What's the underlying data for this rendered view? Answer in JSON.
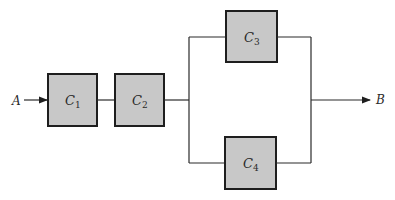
{
  "diagram": {
    "type": "reliability-block-diagram",
    "input_label": "A",
    "output_label": "B",
    "components": [
      {
        "id": "C1",
        "label": "C",
        "sub": "1"
      },
      {
        "id": "C2",
        "label": "C",
        "sub": "2"
      },
      {
        "id": "C3",
        "label": "C",
        "sub": "3"
      },
      {
        "id": "C4",
        "label": "C",
        "sub": "4"
      }
    ],
    "structure": "A -> C1 -> C2 -> (C3 || C4) -> B",
    "colors": {
      "box_fill": "#c8c8c8",
      "stroke": "#1e1e1e",
      "background": "#ffffff"
    }
  }
}
